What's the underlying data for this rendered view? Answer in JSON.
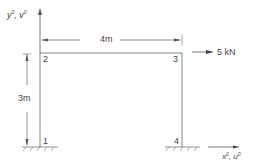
{
  "diagram": {
    "type": "portal-frame",
    "axes": {
      "y_label": "y",
      "y_sup": "0",
      "v_label": "v",
      "v_sup": "0",
      "x_label": "x",
      "x_sup": "0",
      "u_label": "u",
      "u_sup": "0",
      "sep": ", "
    },
    "dimensions": {
      "span": "4m",
      "height": "3m"
    },
    "nodes": [
      {
        "id": "1",
        "label": "1"
      },
      {
        "id": "2",
        "label": "2"
      },
      {
        "id": "3",
        "label": "3"
      },
      {
        "id": "4",
        "label": "4"
      }
    ],
    "load": {
      "value": "5 kN",
      "direction": "right",
      "node": "3"
    },
    "supports": [
      "fixed",
      "fixed"
    ],
    "colors": {
      "line": "#555555",
      "text": "#444444"
    }
  }
}
